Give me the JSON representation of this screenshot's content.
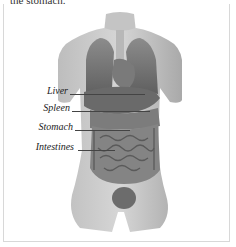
{
  "caption_top": "the stomach.",
  "labels": [
    {
      "text": "Liver",
      "y": 91,
      "line_x1": 70,
      "line_x2": 145
    },
    {
      "text": "Spleen",
      "y": 108,
      "line_x1": 72,
      "line_x2": 150
    },
    {
      "text": "Stomach",
      "y": 127,
      "line_x1": 75,
      "line_x2": 130
    },
    {
      "text": "Intestines",
      "y": 147,
      "line_x1": 78,
      "line_x2": 115
    }
  ],
  "colors": {
    "skin": "#c9c9c9",
    "organ_dark": "#6e6e6e",
    "organ_mid": "#8a8a8a",
    "frame": "#d8d8d8"
  }
}
